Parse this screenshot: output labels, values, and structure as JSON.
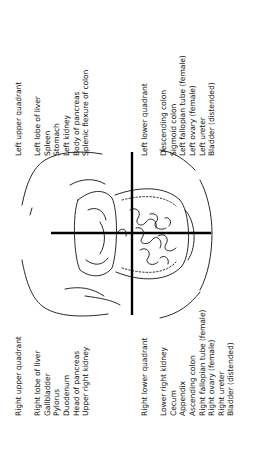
{
  "quadrants": {
    "left_upper": {
      "header": "Left upper quadrant",
      "items": [
        "Left lobe of liver",
        "Spleen",
        "Stomach",
        "Left kidney",
        "Body of pancreas",
        "Splenic flexure of colon"
      ]
    },
    "left_lower": {
      "header": "Left lower quadrant",
      "items": [
        "Descending colon",
        "Sigmoid colon",
        "Left fallopian tube (female)",
        "Left ovary (female)",
        "Left ureter",
        "Bladder (distended)"
      ]
    },
    "right_upper": {
      "header": "Right upper quadrant",
      "items": [
        "Right lobe of liver",
        "Gallbladder",
        "Pylorus",
        "Duodenum",
        "Head of pancreas",
        "Upper right kidney"
      ]
    },
    "right_lower": {
      "header": "Right lower quadrant",
      "items": [
        "Lower right kidney",
        "Cecum",
        "Appendix",
        "Ascending colon",
        "Right fallopian tube (female)",
        "Right ovary (female)",
        "Right ureter",
        "Bladder (distended)"
      ]
    }
  },
  "colors": {
    "line": "#000000",
    "text": "#111111",
    "background": "#ffffff"
  }
}
